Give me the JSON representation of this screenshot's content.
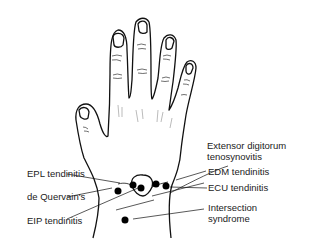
{
  "labels": {
    "extensor": [
      "Extensor digitorum",
      "tenosynovitis"
    ],
    "epl": "EPL tendinitis",
    "dequervain": "de Quervain's",
    "eip": "EIP tendinitis",
    "edm": "EDM tendinitis",
    "ecu": "ECU tendinitis",
    "intersection": [
      "Intersection",
      "syndrome"
    ]
  }
}
